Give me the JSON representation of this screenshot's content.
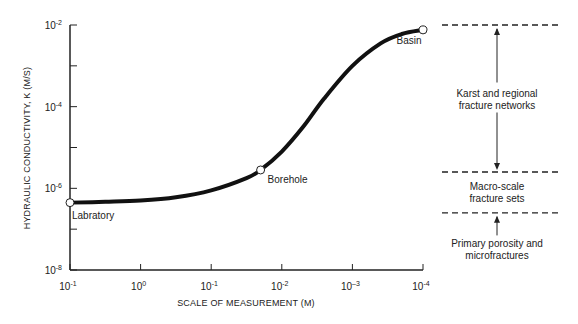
{
  "chart_data": {
    "type": "line",
    "title": "",
    "xlabel": "SCALE OF MEASUREMENT (M)",
    "ylabel": "HYDRAULIC CONDUCTIVITY, K (M/S)",
    "x_ticks": [
      {
        "base": "10",
        "exp": "-1"
      },
      {
        "base": "10",
        "exp": "0"
      },
      {
        "base": "10",
        "exp": "-1"
      },
      {
        "base": "10",
        "exp": "-2"
      },
      {
        "base": "10",
        "exp": "–3"
      },
      {
        "base": "10",
        "exp": "-4"
      }
    ],
    "y_ticks": [
      {
        "base": "10",
        "exp": "-2",
        "log": -2
      },
      {
        "base": "10",
        "exp": "-4",
        "log": -4
      },
      {
        "base": "10",
        "exp": "-6",
        "log": -6
      },
      {
        "base": "10",
        "exp": "-8",
        "log": -8
      }
    ],
    "ylim_log10": [
      -8,
      -2
    ],
    "x_index_range": [
      0,
      5
    ],
    "curve": {
      "x_index": [
        0,
        0.5,
        1,
        1.5,
        2,
        2.5,
        2.7,
        3,
        3.3,
        3.6,
        4,
        4.4,
        4.7,
        5
      ],
      "log10_k": [
        -6.35,
        -6.33,
        -6.3,
        -6.22,
        -6.05,
        -5.75,
        -5.55,
        -5.1,
        -4.5,
        -3.8,
        -3.0,
        -2.45,
        -2.22,
        -2.12
      ]
    },
    "points": [
      {
        "label": "Labratory",
        "x_index": 0,
        "log10_k": -6.35
      },
      {
        "label": "Borehole",
        "x_index": 2.7,
        "log10_k": -5.55
      },
      {
        "label": "Basin",
        "x_index": 5,
        "log10_k": -2.12
      }
    ],
    "zones": [
      {
        "label_lines": [
          "Karst and regional",
          "fracture networks"
        ],
        "from_log10_k": -5.6,
        "to_log10_k": -2.0,
        "arrows": "both"
      },
      {
        "label_lines": [
          "Macro-scale",
          "fracture sets"
        ],
        "from_log10_k": -6.6,
        "to_log10_k": -5.6,
        "arrows": "none"
      },
      {
        "label_lines": [
          "Primary porosity and",
          "microfractures"
        ],
        "from_log10_k": -8,
        "to_log10_k": -6.6,
        "arrows": "up"
      }
    ],
    "boundaries_log10_k": [
      -2.0,
      -5.6,
      -6.6
    ],
    "grid": false,
    "legend": "none"
  }
}
